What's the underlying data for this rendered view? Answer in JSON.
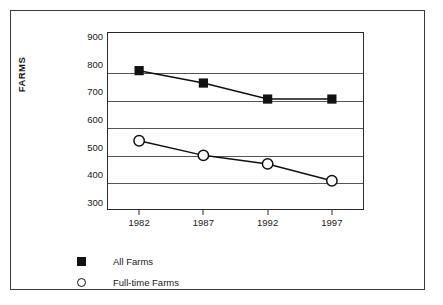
{
  "chart_data": {
    "type": "line",
    "title": "",
    "xlabel": "",
    "ylabel": "FARMS",
    "categories": [
      "1982",
      "1987",
      "1992",
      "1997"
    ],
    "x": [
      1982,
      1987,
      1992,
      1997
    ],
    "ylim": [
      270,
      915
    ],
    "yticks": [
      300,
      400,
      500,
      600,
      700,
      800,
      900
    ],
    "ytick_labels": [
      "300",
      "400",
      "500",
      "600",
      "700",
      "800",
      "900"
    ],
    "gridlines": [
      370,
      470,
      570,
      670,
      770
    ],
    "grid": true,
    "legend_position": "below-left",
    "series": [
      {
        "name": "All Farms",
        "marker": "filled-square",
        "color": "#111111",
        "values": [
          775,
          730,
          672,
          672
        ]
      },
      {
        "name": "Full-time Farms",
        "marker": "open-circle",
        "color": "#111111",
        "values": [
          521,
          468,
          437,
          376
        ]
      }
    ]
  },
  "axes": {
    "y_title": "FARMS",
    "y_tick_labels": [
      "900",
      "800",
      "700",
      "600",
      "500",
      "400",
      "300"
    ],
    "x_tick_labels": [
      "1982",
      "1987",
      "1992",
      "1997"
    ]
  },
  "legend": {
    "items": [
      {
        "label": "All Farms",
        "marker": "filled-square"
      },
      {
        "label": "Full-time Farms",
        "marker": "open-circle"
      }
    ]
  },
  "colors": {
    "ink": "#111111",
    "frame": "#3a3a3a",
    "axis": "#2b2b2b",
    "grid": "#555555",
    "background": "#ffffff"
  }
}
